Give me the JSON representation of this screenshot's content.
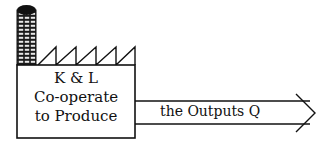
{
  "factory": {
    "line1": "K & L",
    "line2": "Co-operate",
    "line3": "to Produce"
  },
  "arrow": {
    "label": "the Outputs Q"
  },
  "colors": {
    "stroke": "#111111",
    "background": "#ffffff"
  }
}
